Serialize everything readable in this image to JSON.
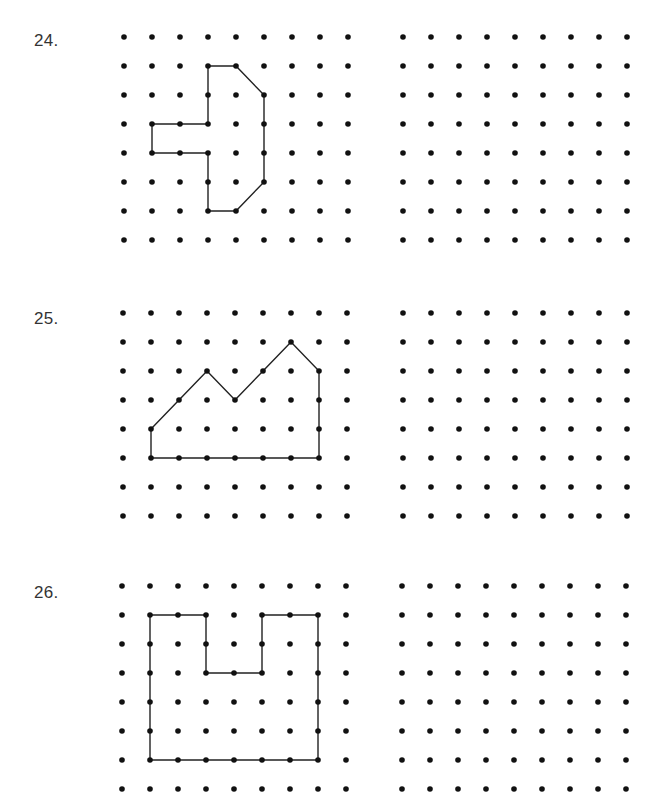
{
  "worksheet": {
    "grid": {
      "columns": 9,
      "rows": 8,
      "spacing_x": 28,
      "spacing_y": 29,
      "dot_radius": 2.8,
      "dot_color": "#111111",
      "line_color": "#222222",
      "line_width": 1.4
    },
    "problems": [
      {
        "number": "24.",
        "label_top": 31,
        "grid_top": 37,
        "left_grid_x": 124,
        "right_grid_x": 403,
        "shape_vertices": [
          [
            3,
            1
          ],
          [
            4,
            1
          ],
          [
            5,
            2
          ],
          [
            5,
            5
          ],
          [
            4,
            6
          ],
          [
            3,
            6
          ],
          [
            3,
            4
          ],
          [
            1,
            4
          ],
          [
            1,
            3
          ],
          [
            3,
            3
          ]
        ]
      },
      {
        "number": "25.",
        "label_top": 309,
        "grid_top": 313,
        "left_grid_x": 123,
        "right_grid_x": 403,
        "shape_vertices": [
          [
            1,
            4
          ],
          [
            2,
            3
          ],
          [
            3,
            2
          ],
          [
            4,
            3
          ],
          [
            5,
            2
          ],
          [
            6,
            1
          ],
          [
            7,
            2
          ],
          [
            7,
            5
          ],
          [
            1,
            5
          ]
        ]
      },
      {
        "number": "26.",
        "label_top": 583,
        "grid_top": 586,
        "left_grid_x": 122,
        "right_grid_x": 402,
        "shape_vertices": [
          [
            1,
            1
          ],
          [
            3,
            1
          ],
          [
            3,
            3
          ],
          [
            5,
            3
          ],
          [
            5,
            1
          ],
          [
            7,
            1
          ],
          [
            7,
            6
          ],
          [
            1,
            6
          ]
        ]
      }
    ]
  }
}
